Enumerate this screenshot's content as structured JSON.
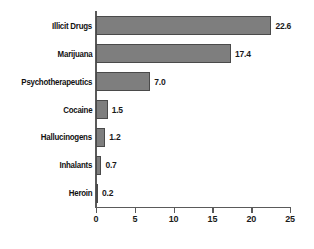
{
  "chart_data": {
    "type": "bar",
    "orientation": "horizontal",
    "title": "",
    "subtitle": "",
    "xlabel": "",
    "ylabel": "",
    "categories": [
      "Illicit Drugs",
      "Marijuana",
      "Psychotherapeutics",
      "Cocaine",
      "Hallucinogens",
      "Inhalants",
      "Heroin"
    ],
    "values": [
      22.6,
      17.4,
      7.0,
      1.5,
      1.2,
      0.7,
      0.2
    ],
    "value_labels": [
      "22.6",
      "17.4",
      "7.0",
      "1.5",
      "1.2",
      "0.7",
      "0.2"
    ],
    "xlim": [
      0,
      25
    ],
    "xticks": [
      0,
      5,
      10,
      15,
      20,
      25
    ],
    "xtick_labels": [
      "0",
      "5",
      "10",
      "15",
      "20",
      "25"
    ],
    "grid": false,
    "legend": null,
    "bar_color": "#7e7e7e",
    "bar_border_color": "#4a4a4a",
    "axis_color": "#5a5a5a",
    "text_color": "#1a1a1a",
    "background": "#ffffff"
  }
}
